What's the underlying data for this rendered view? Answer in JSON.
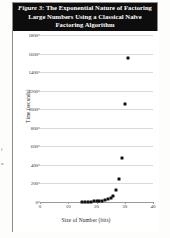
{
  "figure": {
    "caption_label": "Figure 3",
    "caption_separator": ": ",
    "caption_text": "The Exponential Nature of Factoring Large Numbers Using a Classical Naïve Factoring Algorithm"
  },
  "edge_fragments": {
    "frag_1": "l",
    "frag_2": "n"
  },
  "chart_data": {
    "type": "scatter",
    "title": "Figure 3: The Exponential Nature of Factoring Large Numbers Using a Classical Naïve Factoring Algorithm",
    "xlabel": "Size of Number (bits)",
    "ylabel": "Time (seconds)",
    "xlim": [
      0,
      40
    ],
    "ylim": [
      0,
      1800
    ],
    "xticks": [
      0,
      10,
      20,
      30,
      40
    ],
    "yticks": [
      0,
      200,
      400,
      600,
      800,
      1000,
      1200,
      1400,
      1600,
      1800
    ],
    "grid": true,
    "legend": "none",
    "marker_color": "#111111",
    "gridline_color": "#dadada",
    "x": [
      15,
      16,
      17,
      18,
      19,
      20,
      21,
      22,
      23,
      24,
      25,
      26,
      27,
      28,
      29,
      30,
      31
    ],
    "y": [
      1,
      2,
      3,
      4,
      6,
      8,
      11,
      15,
      20,
      28,
      40,
      60,
      130,
      250,
      470,
      1060,
      1550
    ],
    "series": [
      {
        "name": "factoring time",
        "points": [
          {
            "x": 15,
            "y": 1
          },
          {
            "x": 16,
            "y": 2
          },
          {
            "x": 17,
            "y": 3
          },
          {
            "x": 18,
            "y": 4
          },
          {
            "x": 19,
            "y": 6
          },
          {
            "x": 20,
            "y": 8
          },
          {
            "x": 21,
            "y": 11
          },
          {
            "x": 22,
            "y": 15
          },
          {
            "x": 23,
            "y": 20
          },
          {
            "x": 24,
            "y": 28
          },
          {
            "x": 25,
            "y": 40
          },
          {
            "x": 26,
            "y": 60
          },
          {
            "x": 27,
            "y": 130
          },
          {
            "x": 28,
            "y": 250
          },
          {
            "x": 29,
            "y": 470
          },
          {
            "x": 30,
            "y": 1060
          },
          {
            "x": 31,
            "y": 1550
          }
        ]
      }
    ]
  }
}
